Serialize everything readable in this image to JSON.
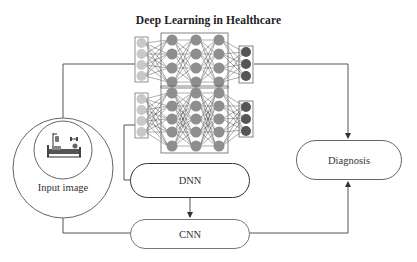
{
  "title": "Deep Learning in Healthcare",
  "input": {
    "label": "Input image",
    "icon": "hospital-bed-icon"
  },
  "nodes": {
    "dnn": "DNN",
    "cnn": "CNN",
    "diagnosis": "Diagnosis"
  },
  "networks": [
    {
      "name": "network-top",
      "layers": [
        4,
        4,
        4,
        4,
        3
      ]
    },
    {
      "name": "network-bottom",
      "layers": [
        4,
        5,
        5,
        5,
        3
      ]
    }
  ],
  "colors": {
    "input_node": "#c8c8c8",
    "hidden_node": "#8e8e8e",
    "output_node": "#555555",
    "line": "#555555"
  },
  "edges": [
    {
      "from": "Input image",
      "to": "network-top"
    },
    {
      "from": "network-top",
      "to": "Diagnosis"
    },
    {
      "from": "network-bottom",
      "to": "DNN"
    },
    {
      "from": "DNN",
      "to": "CNN"
    },
    {
      "from": "Input image",
      "to": "CNN"
    },
    {
      "from": "CNN",
      "to": "Diagnosis"
    }
  ]
}
